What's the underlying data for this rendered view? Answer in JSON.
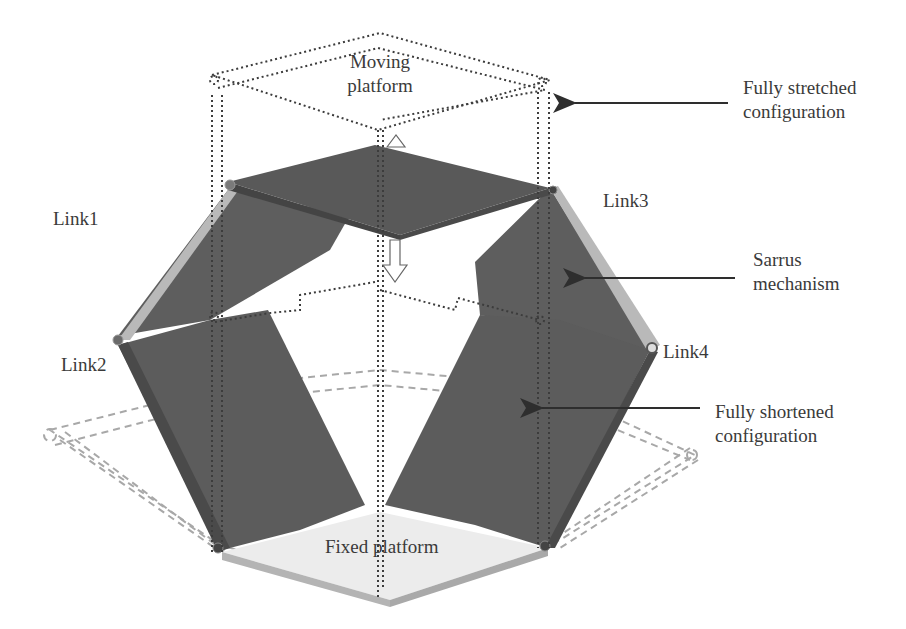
{
  "diagram": {
    "title_hidden": "",
    "colors": {
      "panel_dark": "#5e5e5e",
      "panel_darker": "#4f4f4f",
      "platform_top_dark": "#595959",
      "link_edge_light": "#b9b9b9",
      "fixed_platform_top": "#ececec",
      "fixed_platform_side": "#b4b4b4",
      "dotted_stretched": "#3c3c3c",
      "dashed_shortened": "#a8a8a8",
      "arrow": "#2e2e2e",
      "text": "#3a3a3a"
    },
    "labels": {
      "moving_platform": {
        "line1": "Moving",
        "line2": "platform"
      },
      "fully_stretched": {
        "line1": "Fully stretched",
        "line2": "configuration"
      },
      "link1": "Link1",
      "link2": "Link2",
      "link3": "Link3",
      "link4": "Link4",
      "sarrus": {
        "line1": "Sarrus",
        "line2": "mechanism"
      },
      "fully_shortened": {
        "line1": "Fully shortened",
        "line2": "configuration"
      },
      "fixed_platform": "Fixed platform"
    },
    "annotations": [
      {
        "target": "fully-stretched-configuration",
        "direction": "left"
      },
      {
        "target": "sarrus-mechanism",
        "direction": "left"
      },
      {
        "target": "fully-shortened-configuration",
        "direction": "left"
      }
    ],
    "motion_arrows": [
      {
        "name": "up-arrow",
        "direction": "up"
      },
      {
        "name": "down-arrow",
        "direction": "down"
      }
    ]
  }
}
